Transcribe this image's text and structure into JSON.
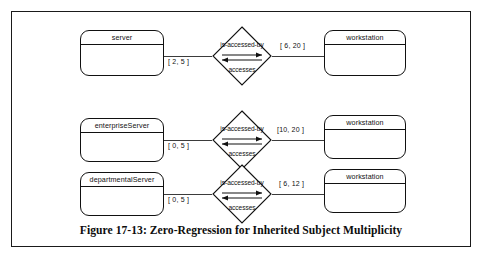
{
  "figure": {
    "caption": "Figure 17-13: Zero-Regression for Inherited Subject Multiplicity"
  },
  "diagram": {
    "type": "entity-relationship",
    "relationship_forward_label": "is-accessed-by",
    "relationship_reverse_label": "accesses",
    "rows": [
      {
        "left_entity": "server",
        "left_multiplicity": "[ 2, 5 ]",
        "relationship_top": "is-accessed-by",
        "relationship_bottom": "accesses",
        "right_multiplicity": "[ 6, 20 ]",
        "right_entity": "workstation"
      },
      {
        "left_entity": "enterpriseServer",
        "left_multiplicity": "[ 0, 5 ]",
        "relationship_top": "is-accessed-by",
        "relationship_bottom": "accesses",
        "right_multiplicity": "[10, 20 ]",
        "right_entity": "workstation"
      },
      {
        "left_entity": "departmentalServer",
        "left_multiplicity": "[ 0, 5 ]",
        "relationship_top": "is-accessed-by",
        "relationship_bottom": "accesses",
        "right_multiplicity": "[ 6, 12 ]",
        "right_entity": "workstation"
      }
    ]
  },
  "colors": {
    "line": "#111111",
    "background": "#ffffff",
    "connector": "#3b3b3b"
  }
}
